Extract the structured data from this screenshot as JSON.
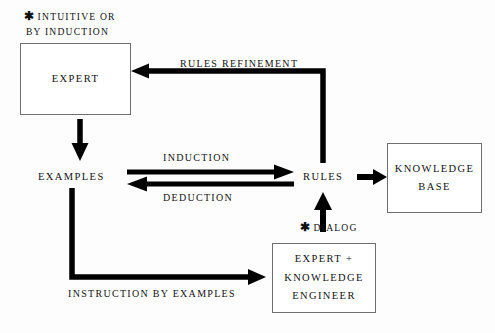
{
  "diagram": {
    "background_color": "#fdfdfd",
    "stroke_color": "#000000",
    "box_border_color": "#6f6f6f",
    "text_color": "#121212",
    "nodes": [
      {
        "id": "expert",
        "name": "expert-box",
        "lines": [
          "EXPERT"
        ],
        "x": 20,
        "y": 43,
        "w": 111,
        "h": 72,
        "boxed": true
      },
      {
        "id": "examples",
        "name": "examples-node",
        "lines": [
          "EXAMPLES"
        ],
        "x": 38,
        "y": 170,
        "w": 68,
        "h": 14,
        "boxed": false
      },
      {
        "id": "rules",
        "name": "rules-node",
        "lines": [
          "RULES"
        ],
        "x": 303,
        "y": 170,
        "w": 45,
        "h": 14,
        "boxed": false
      },
      {
        "id": "knowledge_base",
        "name": "knowledge-base-box",
        "lines": [
          "KNOWLEDGE",
          "BASE"
        ],
        "x": 387,
        "y": 143,
        "w": 95,
        "h": 70,
        "boxed": true
      },
      {
        "id": "expert_knowledge_engineer",
        "name": "expert-knowledge-engineer-box",
        "lines": [
          "EXPERT  +",
          "KNOWLEDGE",
          "ENGINEER"
        ],
        "x": 272,
        "y": 243,
        "w": 104,
        "h": 70,
        "boxed": true
      }
    ],
    "edge_labels": [
      {
        "id": "rules_refinement",
        "name": "rules-refinement-label",
        "text": "RULES REFINEMENT",
        "x": 180,
        "y": 58
      },
      {
        "id": "induction",
        "name": "induction-label",
        "text": "INDUCTION",
        "x": 163,
        "y": 152
      },
      {
        "id": "deduction",
        "name": "deduction-label",
        "text": "DEDUCTION",
        "x": 163,
        "y": 192
      },
      {
        "id": "instruction_by_examples",
        "name": "instruction-by-examples-label",
        "text": "INSTRUCTION BY EXAMPLES",
        "x": 68,
        "y": 288
      }
    ],
    "annotations": [
      {
        "id": "intuitive_note",
        "name": "intuitive-or-by-induction-note",
        "star": "✱",
        "lines": [
          "INTUITIVE OR",
          "BY INDUCTION"
        ],
        "x": 24,
        "y": 8
      },
      {
        "id": "dialog_note",
        "name": "dialog-note",
        "star": "✱",
        "lines": [
          "DIALOG"
        ],
        "x": 300,
        "y": 219
      }
    ],
    "connections": [
      {
        "id": "rules_to_expert",
        "name": "rules-refinement-arrow",
        "from": "rules",
        "to": "expert",
        "label": "RULES REFINEMENT",
        "direction": "up-left"
      },
      {
        "id": "expert_to_examples",
        "name": "expert-to-examples-arrow",
        "from": "expert",
        "to": "examples",
        "direction": "down"
      },
      {
        "id": "examples_to_rules",
        "name": "induction-arrow",
        "from": "examples",
        "to": "rules",
        "label": "INDUCTION",
        "direction": "right"
      },
      {
        "id": "rules_to_examples",
        "name": "deduction-arrow",
        "from": "rules",
        "to": "examples",
        "label": "DEDUCTION",
        "direction": "left"
      },
      {
        "id": "rules_to_kb",
        "name": "rules-to-knowledge-base-arrow",
        "from": "rules",
        "to": "knowledge_base",
        "direction": "right"
      },
      {
        "id": "eke_to_rules",
        "name": "dialog-arrow",
        "from": "expert_knowledge_engineer",
        "to": "rules",
        "label": "DIALOG",
        "direction": "up"
      },
      {
        "id": "examples_to_eke",
        "name": "instruction-by-examples-arrow",
        "from": "examples",
        "to": "expert_knowledge_engineer",
        "label": "INSTRUCTION BY EXAMPLES",
        "direction": "down-right"
      }
    ]
  }
}
